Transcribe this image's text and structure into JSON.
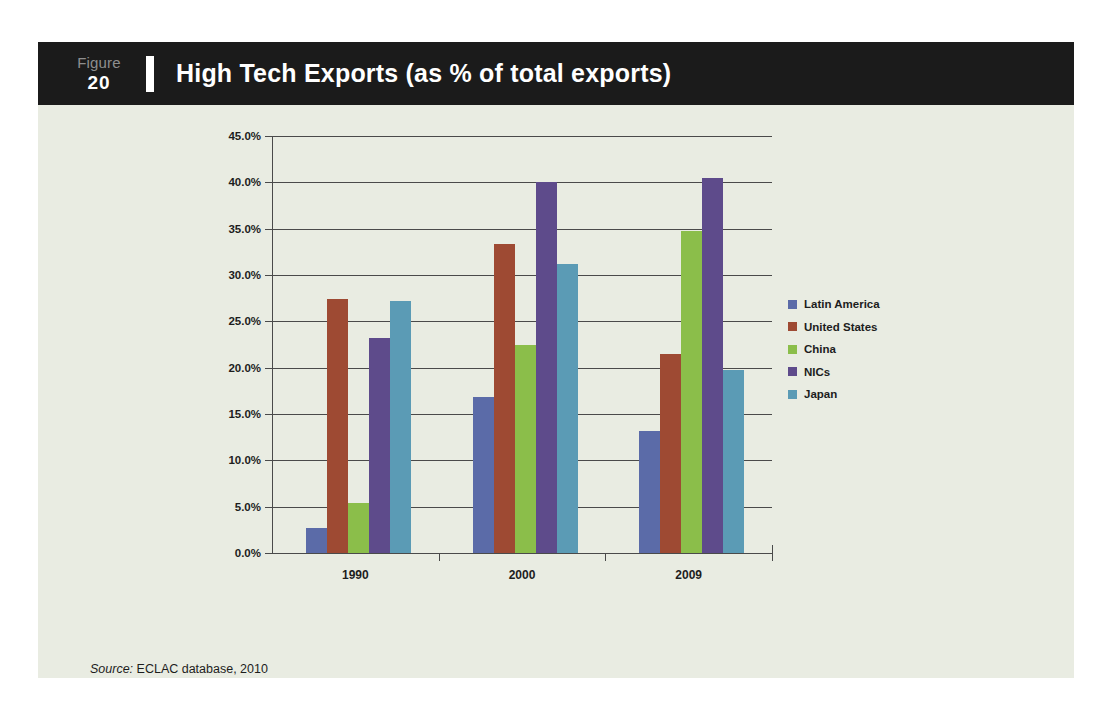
{
  "figure": {
    "label_word": "Figure",
    "number": "20",
    "title": "High Tech Exports (as % of total exports)"
  },
  "source": {
    "prefix": "Source:",
    "text": " ECLAC database, 2010"
  },
  "colors": {
    "card_background": "#e9ece2",
    "header_background": "#1b1b1b",
    "header_text": "#ffffff",
    "figure_word": "#8e8e8e",
    "axis": "#4a4a4a",
    "latin_america": "#5b6ba8",
    "united_states": "#9e4a33",
    "china": "#8bbe4a",
    "nics": "#5e4b8b",
    "japan": "#5b9bb5"
  },
  "chart_data": {
    "type": "bar",
    "title": "High Tech Exports (as % of total exports)",
    "xlabel": "",
    "ylabel": "",
    "categories": [
      "1990",
      "2000",
      "2009"
    ],
    "ylim": [
      0,
      45
    ],
    "ytick_labels": [
      "0.0%",
      "5.0%",
      "10.0%",
      "15.0%",
      "20.0%",
      "25.0%",
      "30.0%",
      "35.0%",
      "40.0%",
      "45.0%"
    ],
    "ytick_values": [
      0,
      5,
      10,
      15,
      20,
      25,
      30,
      35,
      40,
      45
    ],
    "grid": true,
    "legend_position": "right",
    "series": [
      {
        "name": "Latin America",
        "color": "#5b6ba8",
        "values": [
          2.7,
          16.8,
          13.2
        ]
      },
      {
        "name": "United States",
        "color": "#9e4a33",
        "values": [
          27.4,
          33.4,
          21.5
        ]
      },
      {
        "name": "China",
        "color": "#8bbe4a",
        "values": [
          5.4,
          22.4,
          34.7
        ]
      },
      {
        "name": "NICs",
        "color": "#5e4b8b",
        "values": [
          23.2,
          40.0,
          40.5
        ]
      },
      {
        "name": "Japan",
        "color": "#5b9bb5",
        "values": [
          27.2,
          31.2,
          19.7
        ]
      }
    ]
  }
}
